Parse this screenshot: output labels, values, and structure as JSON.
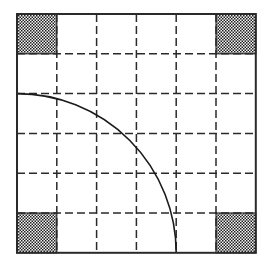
{
  "diagram": {
    "type": "grid-with-quarter-circle",
    "grid": {
      "rows": 6,
      "cols": 6,
      "origin_x": 17,
      "origin_y": 14,
      "cell_size": 39.8,
      "outer_border": "solid",
      "inner_lines": "dashed",
      "line_color": "#2a2a2a",
      "dash_pattern": "8 4"
    },
    "shaded_cells": [
      {
        "row": 0,
        "col": 0,
        "position": "top-left"
      },
      {
        "row": 0,
        "col": 5,
        "position": "top-right"
      },
      {
        "row": 5,
        "col": 0,
        "position": "bottom-left"
      },
      {
        "row": 5,
        "col": 5,
        "position": "bottom-right"
      }
    ],
    "shade_pattern": "checkered",
    "shade_colors": [
      "#1f1f1f",
      "#f4f4f4"
    ],
    "arc": {
      "description": "quarter circle centered at bottom-left corner",
      "center_corner": "bottom-left",
      "radius_cells": 4,
      "stroke_color": "#1a1a1a"
    },
    "background": "#ffffff"
  }
}
